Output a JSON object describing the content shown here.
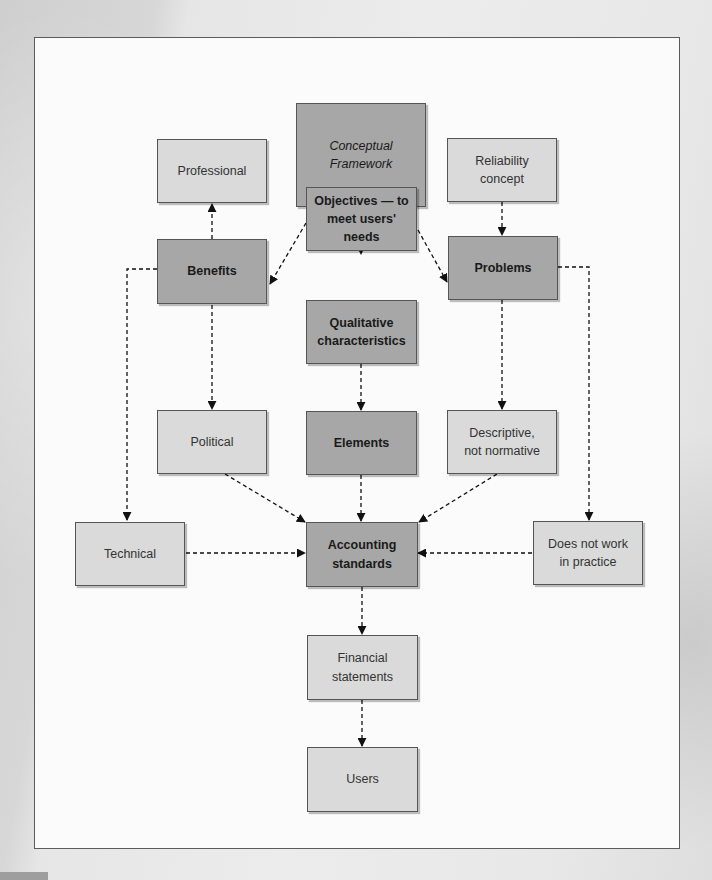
{
  "diagram": {
    "type": "flowchart",
    "connector_style": "dashed-arrow",
    "colors": {
      "primary_node": "#a7a7a7",
      "secondary_node": "#dadada",
      "frame_background": "#fbfbfb",
      "border": "#555555"
    },
    "nodes": {
      "conceptual_framework": {
        "label": "Conceptual\nFramework",
        "style": "primary-italic"
      },
      "professional": {
        "label": "Professional",
        "style": "secondary"
      },
      "reliability_concept": {
        "label": "Reliability\nconcept",
        "style": "secondary"
      },
      "objectives": {
        "label": "Objectives — to\nmeet users' needs",
        "style": "primary"
      },
      "benefits": {
        "label": "Benefits",
        "style": "primary"
      },
      "problems": {
        "label": "Problems",
        "style": "primary"
      },
      "qualitative_characteristics": {
        "label": "Qualitative\ncharacteristics",
        "style": "primary"
      },
      "political": {
        "label": "Political",
        "style": "secondary"
      },
      "elements": {
        "label": "Elements",
        "style": "primary"
      },
      "descriptive_not_normative": {
        "label": "Descriptive,\nnot normative",
        "style": "secondary"
      },
      "technical": {
        "label": "Technical",
        "style": "secondary"
      },
      "accounting_standards": {
        "label": "Accounting\nstandards",
        "style": "primary"
      },
      "does_not_work_in_practice": {
        "label": "Does not work\nin practice",
        "style": "secondary"
      },
      "financial_statements": {
        "label": "Financial\nstatements",
        "style": "secondary"
      },
      "users": {
        "label": "Users",
        "style": "secondary"
      }
    },
    "edges": [
      {
        "from": "conceptual_framework",
        "to": "objectives"
      },
      {
        "from": "objectives",
        "to": "benefits"
      },
      {
        "from": "objectives",
        "to": "problems"
      },
      {
        "from": "objectives",
        "to": "qualitative_characteristics"
      },
      {
        "from": "benefits",
        "to": "professional"
      },
      {
        "from": "benefits",
        "to": "political"
      },
      {
        "from": "benefits",
        "to": "technical"
      },
      {
        "from": "reliability_concept",
        "to": "problems"
      },
      {
        "from": "problems",
        "to": "descriptive_not_normative"
      },
      {
        "from": "problems",
        "to": "does_not_work_in_practice"
      },
      {
        "from": "qualitative_characteristics",
        "to": "elements"
      },
      {
        "from": "political",
        "to": "accounting_standards"
      },
      {
        "from": "elements",
        "to": "accounting_standards"
      },
      {
        "from": "descriptive_not_normative",
        "to": "accounting_standards"
      },
      {
        "from": "technical",
        "to": "accounting_standards"
      },
      {
        "from": "does_not_work_in_practice",
        "to": "accounting_standards"
      },
      {
        "from": "accounting_standards",
        "to": "financial_statements"
      },
      {
        "from": "financial_statements",
        "to": "users"
      }
    ]
  }
}
